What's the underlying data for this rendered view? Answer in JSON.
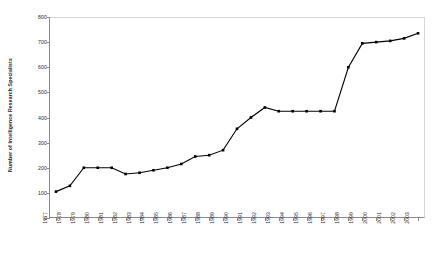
{
  "chart_data": {
    "type": "line",
    "title": "",
    "xlabel": "",
    "ylabel": "Number of Intelligence Research Specialists",
    "ylim": [
      0,
      800
    ],
    "yticks": [
      0,
      100,
      200,
      300,
      400,
      500,
      600,
      700,
      800
    ],
    "grid": false,
    "legend": null,
    "marker": "square",
    "line_color": "#000000",
    "marker_color": "#000000",
    "categories": [
      "1977",
      "1978",
      "1979",
      "1980",
      "1981",
      "1982",
      "1983",
      "1984",
      "1985",
      "1986",
      "1987",
      "1988",
      "1989",
      "1990",
      "1991",
      "1992",
      "1993",
      "1994",
      "1995",
      "1996",
      "1997",
      "1998",
      "1999",
      "2000",
      "2001",
      "2002",
      "2003"
    ],
    "values": [
      105,
      128,
      200,
      200,
      200,
      175,
      180,
      190,
      200,
      215,
      245,
      250,
      270,
      355,
      400,
      440,
      425,
      425,
      425,
      425,
      425,
      600,
      695,
      700,
      705,
      715,
      735
    ]
  }
}
